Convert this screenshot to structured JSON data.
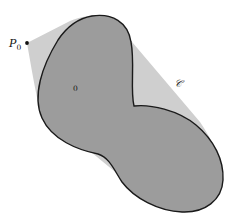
{
  "figure": {
    "point_label": {
      "base": "P",
      "sub": "0"
    },
    "body_label": {
      "base": "𝒝",
      "sub": "0"
    },
    "hull_label": {
      "base": "𝒞",
      "sub": "𝒝"
    },
    "colors": {
      "background": "#ffffff",
      "body_fill": "#9c9c9c",
      "hull_fill": "#cfcfcf",
      "outline": "#1a1a1a",
      "point": "#111111"
    }
  }
}
